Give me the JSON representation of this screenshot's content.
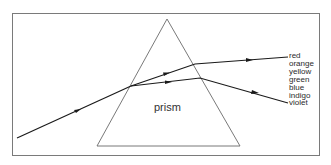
{
  "diagram": {
    "prism_label": "prism",
    "spectrum_labels": [
      "red",
      "orange",
      "yellow",
      "green",
      "blue",
      "indigo",
      "violet"
    ],
    "colors": {
      "frame": "#7a7a7a",
      "prism": "#6a6a6a",
      "ray": "#1a1a1a",
      "text": "#2a2a2a"
    },
    "geometry": {
      "frame": {
        "x": 12,
        "y": 13,
        "width": 308,
        "height": 143
      },
      "prism": {
        "apex": [
          167,
          19
        ],
        "base_left": [
          97,
          146
        ],
        "base_right": [
          240,
          146
        ]
      },
      "incident_ray": {
        "from": [
          17,
          138
        ],
        "to": [
          131,
          86
        ]
      },
      "red_ray": {
        "points": [
          [
            131,
            86
          ],
          [
            195,
            64
          ],
          [
            288,
            57
          ]
        ]
      },
      "violet_ray": {
        "points": [
          [
            131,
            86
          ],
          [
            200,
            78
          ],
          [
            288,
            103
          ]
        ]
      }
    }
  }
}
